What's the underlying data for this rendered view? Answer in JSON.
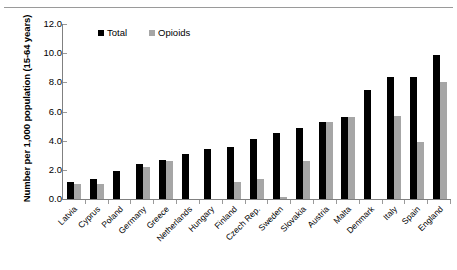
{
  "chart_data": {
    "type": "bar",
    "title": "",
    "subtitle": "",
    "xlabel": "",
    "ylabel": "Number per 1,000 population (15-64 years)",
    "ylim": [
      0,
      12
    ],
    "ytick_labels": [
      "12.0",
      "10.0",
      "8.0",
      "6.0",
      "4.0",
      "2.0",
      "0.0"
    ],
    "ytick_values": [
      12.0,
      10.0,
      8.0,
      6.0,
      4.0,
      2.0,
      0.0
    ],
    "grid": false,
    "legend_position": "top-center",
    "categories": [
      "Latvia",
      "Cyprus",
      "Poland",
      "Germany",
      "Greece",
      "Netherlands",
      "Hungary",
      "Finland",
      "Czech Rep.",
      "Sweden",
      "Slovakia",
      "Austria",
      "Malta",
      "Denmark",
      "Italy",
      "Spain",
      "England"
    ],
    "series": [
      {
        "name": "Total",
        "color": "#000000",
        "values": [
          1.15,
          1.35,
          1.9,
          2.4,
          2.7,
          3.1,
          3.4,
          3.6,
          4.1,
          4.5,
          4.9,
          5.3,
          5.6,
          7.5,
          8.4,
          8.4,
          9.9
        ]
      },
      {
        "name": "Opioids",
        "color": "#a6a6a6",
        "values": [
          1.05,
          1.05,
          0.0,
          2.2,
          2.6,
          0.0,
          0.0,
          1.15,
          1.4,
          0.15,
          2.6,
          5.3,
          5.6,
          0.0,
          5.7,
          3.9,
          8.0
        ]
      }
    ]
  },
  "legend": {
    "entries": [
      {
        "label": "Total",
        "color": "#000000"
      },
      {
        "label": "Opioids",
        "color": "#a6a6a6"
      }
    ]
  }
}
